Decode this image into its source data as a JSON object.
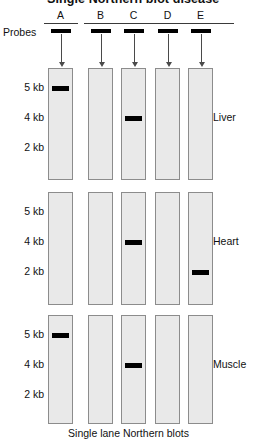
{
  "figure": {
    "title_partial": "Single Northern blot disease",
    "probes_label": "Probes",
    "caption": "Single lane Northern blots"
  },
  "probes": [
    {
      "letter": "A"
    },
    {
      "letter": "B"
    },
    {
      "letter": "C"
    },
    {
      "letter": "D"
    },
    {
      "letter": "E"
    }
  ],
  "axis": {
    "tick_labels": [
      "5 kb",
      "4 kb",
      "2 kb"
    ]
  },
  "panels": [
    {
      "name": "Liver"
    },
    {
      "name": "Heart"
    },
    {
      "name": "Muscle"
    }
  ],
  "chart_data": {
    "type": "table",
    "title": "Single lane Northern blots",
    "xlabel": "Probes",
    "ylabel": "Transcript size",
    "categories": [
      "A",
      "B",
      "C",
      "D",
      "E"
    ],
    "tick_labels": [
      "5 kb",
      "4 kb",
      "2 kb"
    ],
    "series": [
      {
        "name": "Liver",
        "values": [
          "5 kb",
          "",
          "4 kb",
          "",
          ""
        ]
      },
      {
        "name": "Heart",
        "values": [
          "",
          "",
          "4 kb",
          "",
          "2 kb"
        ]
      },
      {
        "name": "Muscle",
        "values": [
          "5 kb",
          "",
          "4 kb",
          "",
          ""
        ]
      }
    ],
    "bands": [
      {
        "panel": "Liver",
        "lane": "A",
        "size": "5 kb"
      },
      {
        "panel": "Liver",
        "lane": "C",
        "size": "4 kb"
      },
      {
        "panel": "Heart",
        "lane": "C",
        "size": "4 kb"
      },
      {
        "panel": "Heart",
        "lane": "E",
        "size": "2 kb"
      },
      {
        "panel": "Muscle",
        "lane": "A",
        "size": "5 kb"
      },
      {
        "panel": "Muscle",
        "lane": "C",
        "size": "4 kb"
      }
    ],
    "grid": false,
    "legend_position": "right"
  },
  "colors": {
    "band": "#000000",
    "lane_fill": "#e9e9e9",
    "lane_border": "#8c8c8c",
    "text": "#111111"
  }
}
